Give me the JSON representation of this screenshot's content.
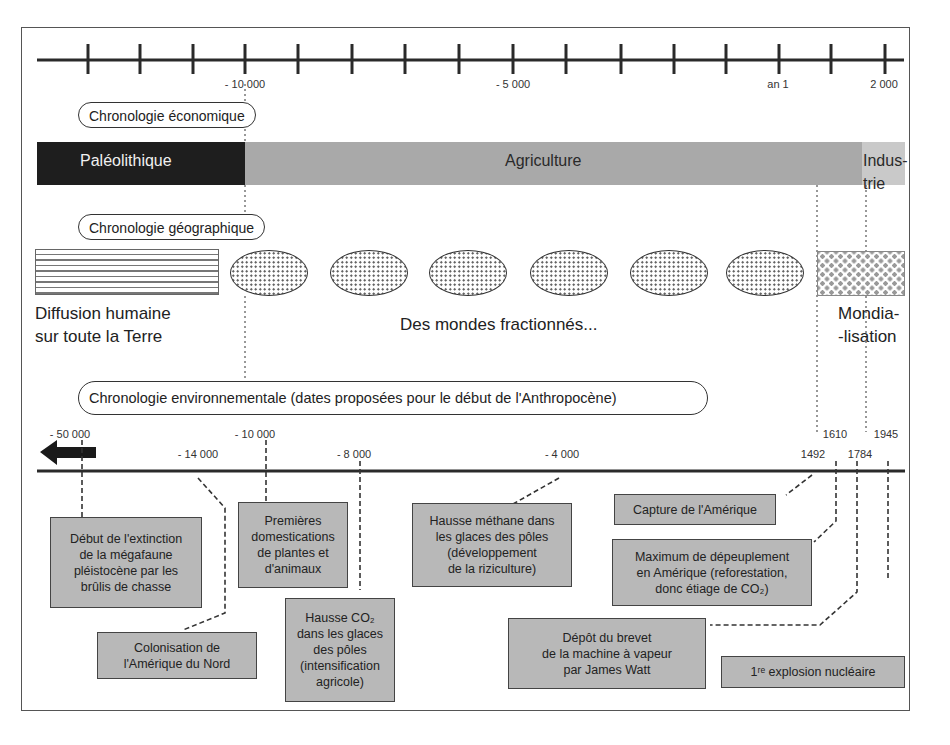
{
  "top_axis": {
    "tick_count": 16,
    "labels": [
      {
        "text": "- 10 000",
        "x": 245
      },
      {
        "text": "- 5 000",
        "x": 513
      },
      {
        "text": "an 1",
        "x": 778
      },
      {
        "text": "2 000",
        "x": 884
      }
    ]
  },
  "economic": {
    "title": "Chronologie économique",
    "periods": [
      {
        "label": "Paléolithique",
        "color": "#1e1e1e"
      },
      {
        "label": "Agriculture",
        "color": "#a9a9a9"
      },
      {
        "label_line1": "Indus-",
        "label_line2": "trie",
        "color": "#c9c9c9"
      }
    ]
  },
  "geographic": {
    "title": "Chronologie géographique",
    "diffusion_line1": "Diffusion humaine",
    "diffusion_line2": "sur toute la Terre",
    "fractioned": "Des mondes fractionnés...",
    "mondial_line1": "Mondia-",
    "mondial_line2": "-lisation",
    "ellipse_count": 6
  },
  "environmental": {
    "title": "Chronologie environnementale (dates proposées pour le début de l'Anthropocène)",
    "dates": [
      {
        "text": "- 50 000"
      },
      {
        "text": "- 14 000"
      },
      {
        "text": "- 10 000"
      },
      {
        "text": "- 8 000"
      },
      {
        "text": "- 4 000"
      },
      {
        "text": "1492"
      },
      {
        "text": "1610"
      },
      {
        "text": "1784"
      },
      {
        "text": "1945"
      }
    ],
    "events": [
      {
        "text": "Début de l'extinction\nde la mégafaune\npléistocène par les\nbrûlis de chasse"
      },
      {
        "text": "Colonisation de\nl'Amérique du Nord"
      },
      {
        "text": "Premières\ndomestications\nde plantes et\nd'animaux"
      },
      {
        "text": "Hausse CO₂\ndans les glaces\ndes pôles\n(intensification\nagricole)"
      },
      {
        "text": "Hausse méthane dans\nles glaces des pôles\n(développement\nde la riziculture)"
      },
      {
        "text": "Capture de l'Amérique"
      },
      {
        "text": "Maximum de dépeuplement\nen Amérique (reforestation,\ndonc étiage de CO₂)"
      },
      {
        "text": "Dépôt du brevet\nde la machine à vapeur\npar James Watt"
      },
      {
        "text": "1ʳᵉ explosion nucléaire"
      }
    ]
  }
}
